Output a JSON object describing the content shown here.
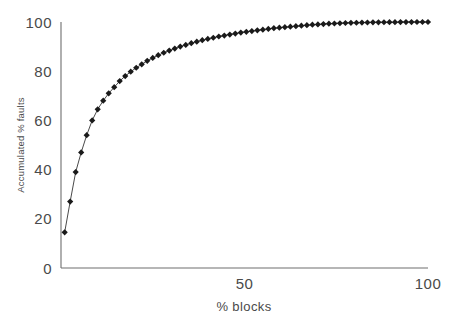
{
  "chart_data": {
    "type": "line",
    "title": "",
    "subtitle": "",
    "xlabel": "% blocks",
    "ylabel": "Accumulated % faults",
    "xlim": [
      0,
      100
    ],
    "ylim": [
      0,
      100
    ],
    "grid": false,
    "legend": "none",
    "marker": "diamond",
    "line_color": "#4a4a4a",
    "marker_color": "#1a1a1a",
    "axis_color": "#6e6e6e",
    "background_color": "#ffffff",
    "x_ticks": [
      50,
      100
    ],
    "x_tick_labels": [
      "50",
      "100"
    ],
    "y_ticks": [
      0,
      20,
      40,
      60,
      80,
      100
    ],
    "y_tick_labels": [
      "0",
      "20",
      "40",
      "60",
      "80",
      "100"
    ],
    "annotations": [],
    "series": [
      {
        "name": "Accumulated % faults",
        "x": [
          1,
          2.5,
          4,
          5.5,
          7,
          8.5,
          10,
          11.5,
          13,
          14.5,
          16,
          17.5,
          19,
          20.5,
          22,
          23.5,
          25,
          26.5,
          28,
          29.5,
          31,
          32.5,
          34,
          35.5,
          37,
          38.5,
          40,
          41.5,
          43,
          44.5,
          46,
          47.5,
          49,
          50.5,
          52,
          53.5,
          55,
          56.5,
          58,
          59.5,
          61,
          62.5,
          64,
          65.5,
          67,
          68.5,
          70,
          71.5,
          73,
          74.5,
          76,
          77.5,
          79,
          80.5,
          82,
          83.5,
          85,
          86.5,
          88,
          89.5,
          91,
          92.5,
          94,
          95.5,
          97,
          98.5,
          100
        ],
        "y": [
          14.5,
          27,
          39,
          47,
          54,
          60,
          64.5,
          68,
          71,
          73.5,
          76,
          78,
          79.8,
          81.4,
          82.8,
          84.2,
          85.4,
          86.5,
          87.5,
          88.4,
          89.2,
          90,
          90.7,
          91.4,
          92,
          92.6,
          93.1,
          93.6,
          94.1,
          94.5,
          94.9,
          95.3,
          95.7,
          96,
          96.3,
          96.6,
          96.9,
          97.2,
          97.5,
          97.7,
          97.9,
          98.1,
          98.3,
          98.5,
          98.7,
          98.9,
          99,
          99.15,
          99.3,
          99.4,
          99.5,
          99.6,
          99.65,
          99.7,
          99.75,
          99.8,
          99.85,
          99.88,
          99.9,
          99.92,
          99.94,
          99.96,
          99.97,
          99.98,
          99.99,
          100,
          100
        ]
      }
    ]
  }
}
